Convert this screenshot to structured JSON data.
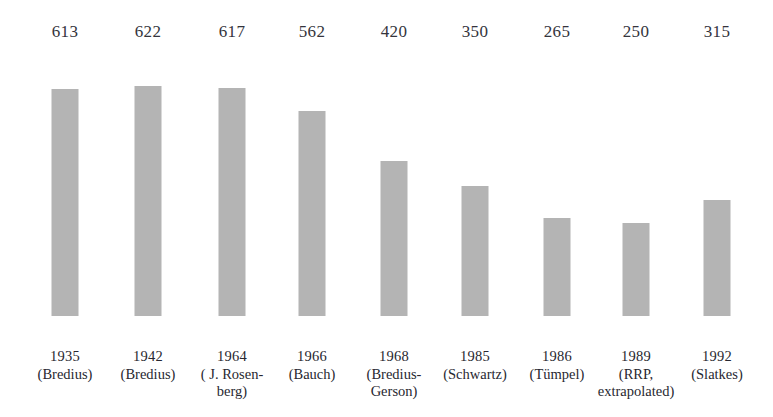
{
  "figure": {
    "background": "#ffffff",
    "bar_color": "#b4b4b4",
    "text_color": "#2b2b33",
    "baseline_y": 316
  },
  "chart_data": {
    "type": "bar",
    "title": "",
    "subtitle": "",
    "xlabel": "",
    "ylabel": "",
    "grid": false,
    "legend": "none",
    "ylim": [
      0,
      700
    ],
    "categories": [
      "1935 (Bredius)",
      "1942 (Bredius)",
      "1964 (J. Rosenberg)",
      "1966 (Bauch)",
      "1968 (Bredius-Gerson)",
      "1985 (Schwartz)",
      "1986 (Tümpel)",
      "1989 (RRP, extrapolated)",
      "1992 (Slatkes)"
    ],
    "values": [
      613,
      622,
      617,
      562,
      420,
      350,
      265,
      250,
      315
    ],
    "value_labels": [
      "613",
      "622",
      "617",
      "562",
      "420",
      "350",
      "265",
      "250",
      "315"
    ],
    "bars": [
      {
        "value": 613,
        "value_label": "613",
        "year": "1935",
        "source": "(Bredius)",
        "source_line2": "",
        "center_x": 65,
        "bar_height": 227
      },
      {
        "value": 622,
        "value_label": "622",
        "year": "1942",
        "source": "(Bredius)",
        "source_line2": "",
        "center_x": 148,
        "bar_height": 230
      },
      {
        "value": 617,
        "value_label": "617",
        "year": "1964",
        "source": "( J. Rosen-",
        "source_line2": "berg)",
        "center_x": 232,
        "bar_height": 228
      },
      {
        "value": 562,
        "value_label": "562",
        "year": "1966",
        "source": "(Bauch)",
        "source_line2": "",
        "center_x": 312,
        "bar_height": 205
      },
      {
        "value": 420,
        "value_label": "420",
        "year": "1968",
        "source": "(Bredius-",
        "source_line2": "Gerson)",
        "center_x": 394,
        "bar_height": 155
      },
      {
        "value": 350,
        "value_label": "350",
        "year": "1985",
        "source": "(Schwartz)",
        "source_line2": "",
        "center_x": 475,
        "bar_height": 130
      },
      {
        "value": 265,
        "value_label": "265",
        "year": "1986",
        "source": "(Tümpel)",
        "source_line2": "",
        "center_x": 557,
        "bar_height": 98
      },
      {
        "value": 250,
        "value_label": "250",
        "year": "1989",
        "source": "(RRP,",
        "source_line2": "extrapolated)",
        "center_x": 636,
        "bar_height": 93
      },
      {
        "value": 315,
        "value_label": "315",
        "year": "1992",
        "source": "(Slatkes)",
        "source_line2": "",
        "center_x": 717,
        "bar_height": 116
      }
    ]
  }
}
